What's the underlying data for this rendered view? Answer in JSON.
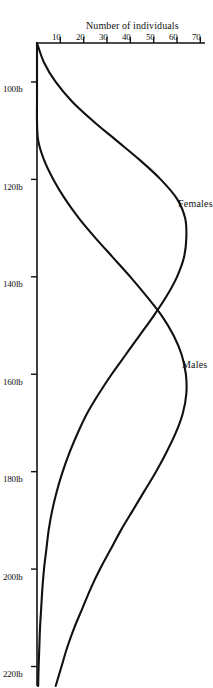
{
  "chart_data": {
    "type": "line",
    "title": "",
    "subtitle": "",
    "xlabel": "",
    "ylabel": "Number of individuals",
    "xlim": [
      92,
      224
    ],
    "ylim": [
      0,
      72
    ],
    "grid": false,
    "legend": "inline-annotations",
    "x_tick_labels": [
      "100lb",
      "120lb",
      "140lb",
      "160lb",
      "180lb",
      "200lb",
      "220lb"
    ],
    "x_tick_values": [
      100,
      120,
      140,
      160,
      180,
      200,
      220
    ],
    "y_tick_labels": [
      "10",
      "20",
      "30",
      "40",
      "50",
      "60",
      "70"
    ],
    "y_tick_values": [
      10,
      20,
      30,
      40,
      50,
      60,
      70
    ],
    "x": [
      92,
      96,
      100,
      104,
      108,
      112,
      116,
      120,
      124,
      128,
      132,
      136,
      140,
      144,
      148,
      152,
      156,
      160,
      164,
      168,
      172,
      176,
      180,
      184,
      188,
      192,
      196,
      200,
      204,
      208,
      212,
      216,
      220,
      224
    ],
    "series": [
      {
        "name": "Females",
        "label": "Females",
        "color": "#111111",
        "peak_x": 129,
        "peak_y": 64,
        "values": [
          0,
          3,
          8,
          15,
          24,
          34,
          44,
          53,
          60,
          63.5,
          64,
          63,
          60,
          55.5,
          50,
          44,
          38,
          32,
          26.5,
          21.5,
          17.5,
          14,
          11,
          8.5,
          6.5,
          5,
          4,
          3,
          2.3,
          1.8,
          1.3,
          1,
          0.7,
          0.5
        ]
      },
      {
        "name": "Males",
        "label": "Males",
        "color": "#111111",
        "peak_x": 160,
        "peak_y": 64,
        "values": [
          0,
          0,
          0,
          0,
          0,
          0.5,
          3,
          7,
          12,
          18,
          25,
          32.5,
          40,
          47,
          53.5,
          58.5,
          62,
          63.8,
          64,
          62.5,
          59.5,
          55.5,
          51,
          46,
          41,
          36,
          31.5,
          27,
          23,
          19.5,
          16,
          13,
          10.5,
          8
        ]
      }
    ],
    "annotations": [
      {
        "name": "Females",
        "text": "Females",
        "at_x": 125,
        "at_y": 69
      },
      {
        "name": "Males",
        "text": "Males",
        "at_x": 158,
        "at_y": 69
      }
    ],
    "crossing_point": {
      "x": 145,
      "y": 54
    }
  },
  "axes": {
    "y_axis_title": "Number of individuals",
    "x_ticks": [
      {
        "label": "100lb",
        "value": 100
      },
      {
        "label": "120lb",
        "value": 120
      },
      {
        "label": "140lb",
        "value": 140
      },
      {
        "label": "160lb",
        "value": 160
      },
      {
        "label": "180lb",
        "value": 180
      },
      {
        "label": "200lb",
        "value": 200
      },
      {
        "label": "220lb",
        "value": 220
      }
    ],
    "y_ticks": [
      {
        "label": "70",
        "value": 70
      },
      {
        "label": "60",
        "value": 60
      },
      {
        "label": "50",
        "value": 50
      },
      {
        "label": "40",
        "value": 40
      },
      {
        "label": "30",
        "value": 30
      },
      {
        "label": "20",
        "value": 20
      },
      {
        "label": "10",
        "value": 10
      }
    ]
  },
  "style": {
    "background": "#ffffff",
    "ink": "#111111",
    "curve_stroke_width": 2.1,
    "axis_stroke_width": 1.6
  }
}
